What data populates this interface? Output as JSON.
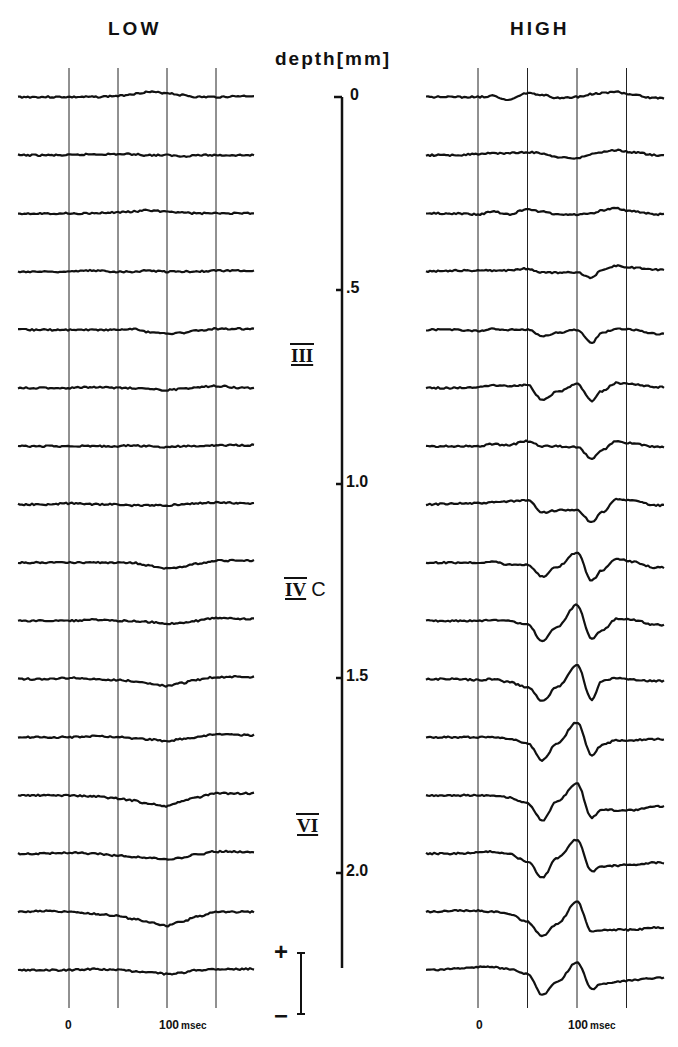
{
  "titles": {
    "low": "LOW",
    "high": "HIGH",
    "depth_axis": "depth[mm]"
  },
  "depth_axis": {
    "ticks": [
      "0",
      ".5",
      "1.0",
      "1.5",
      "2.0"
    ],
    "layers": [
      {
        "label": "III",
        "suffix": ""
      },
      {
        "label": "IV",
        "suffix": "C"
      },
      {
        "label": "VI",
        "suffix": ""
      }
    ]
  },
  "time_axis": {
    "low": {
      "zero": "0",
      "hundred": "100",
      "unit": "msec"
    },
    "high": {
      "zero": "0",
      "hundred": "100",
      "unit": "msec"
    }
  },
  "polarity": {
    "plus": "+",
    "minus": "−"
  },
  "chart_data": [
    {
      "type": "line",
      "title": "LOW",
      "description": "16 stacked field-potential traces at increasing cortical depth (0 to ~2.25 mm, ~0.15 mm spacing)",
      "xlabel": "msec",
      "x_tick_labels": [
        "0",
        "100 msec"
      ],
      "x_gridlines_msec": [
        0,
        50,
        100,
        150
      ],
      "x_range_msec": [
        -50,
        180
      ],
      "ylabel": "depth [mm]",
      "depths_mm": [
        0.0,
        0.15,
        0.3,
        0.45,
        0.6,
        0.75,
        0.9,
        1.05,
        1.2,
        1.35,
        1.5,
        1.65,
        1.8,
        1.95,
        2.1,
        2.25
      ],
      "x": [
        -50,
        -25,
        0,
        25,
        50,
        65,
        80,
        100,
        115,
        130,
        150,
        180
      ],
      "series": [
        {
          "name": "d0.00",
          "values": [
            0,
            0,
            0,
            0,
            1,
            3,
            5,
            4,
            2,
            0,
            0,
            1
          ]
        },
        {
          "name": "d0.15",
          "values": [
            0,
            0,
            0,
            1,
            1,
            1,
            0,
            0,
            -1,
            0,
            0,
            0
          ]
        },
        {
          "name": "d0.30",
          "values": [
            0,
            0,
            0,
            0,
            1,
            2,
            3,
            2,
            1,
            0,
            0,
            0
          ]
        },
        {
          "name": "d0.45",
          "values": [
            0,
            0,
            0,
            1,
            0,
            0,
            1,
            0,
            0,
            0,
            1,
            1
          ]
        },
        {
          "name": "d0.60",
          "values": [
            0,
            0,
            0,
            0,
            0,
            1,
            -2,
            -4,
            -3,
            -1,
            1,
            1
          ]
        },
        {
          "name": "d0.75",
          "values": [
            0,
            0,
            0,
            1,
            0,
            0,
            -1,
            -2,
            -1,
            1,
            2,
            0
          ]
        },
        {
          "name": "d0.90",
          "values": [
            0,
            0,
            0,
            0,
            0,
            1,
            0,
            -1,
            0,
            0,
            1,
            1
          ]
        },
        {
          "name": "d1.05",
          "values": [
            0,
            0,
            1,
            0,
            0,
            -1,
            -1,
            -1,
            0,
            1,
            2,
            1
          ]
        },
        {
          "name": "d1.20",
          "values": [
            0,
            0,
            0,
            0,
            0,
            0,
            -3,
            -6,
            -4,
            -1,
            2,
            2
          ]
        },
        {
          "name": "d1.35",
          "values": [
            0,
            0,
            0,
            1,
            0,
            0,
            -1,
            -3,
            -2,
            0,
            3,
            2
          ]
        },
        {
          "name": "d1.50",
          "values": [
            0,
            0,
            1,
            0,
            -1,
            -2,
            -4,
            -7,
            -4,
            -1,
            2,
            2
          ]
        },
        {
          "name": "d1.65",
          "values": [
            0,
            0,
            0,
            1,
            0,
            -1,
            -2,
            -4,
            -2,
            0,
            3,
            2
          ]
        },
        {
          "name": "d1.80",
          "values": [
            0,
            0,
            0,
            -1,
            -3,
            -5,
            -8,
            -11,
            -6,
            -2,
            2,
            2
          ]
        },
        {
          "name": "d1.95",
          "values": [
            0,
            0,
            1,
            0,
            -2,
            -3,
            -4,
            -6,
            -4,
            -1,
            2,
            2
          ]
        },
        {
          "name": "d2.10",
          "values": [
            0,
            1,
            0,
            -2,
            -4,
            -7,
            -10,
            -14,
            -10,
            -5,
            0,
            0
          ]
        },
        {
          "name": "d2.25",
          "values": [
            0,
            0,
            0,
            1,
            0,
            -1,
            -2,
            -4,
            -3,
            0,
            1,
            1
          ]
        }
      ],
      "units": "relative deflection (px-scaled, upward positive)"
    },
    {
      "type": "line",
      "title": "HIGH",
      "description": "16 stacked field-potential traces at increasing cortical depth; prominent negative wave ~65 msec and ~125 msec in deep layers, positive peak ~100 msec",
      "xlabel": "msec",
      "x_tick_labels": [
        "0",
        "100 msec"
      ],
      "x_gridlines_msec": [
        0,
        50,
        100,
        150
      ],
      "x_range_msec": [
        -50,
        180
      ],
      "ylabel": "depth [mm]",
      "depths_mm": [
        0.0,
        0.15,
        0.3,
        0.45,
        0.6,
        0.75,
        0.9,
        1.05,
        1.2,
        1.35,
        1.5,
        1.65,
        1.8,
        1.95,
        2.1,
        2.25
      ],
      "x": [
        -50,
        -25,
        0,
        15,
        30,
        50,
        65,
        80,
        100,
        115,
        125,
        140,
        155,
        180
      ],
      "series": [
        {
          "name": "d0.00",
          "values": [
            0,
            0,
            0,
            1,
            -3,
            4,
            2,
            -1,
            0,
            3,
            4,
            5,
            2,
            -1
          ]
        },
        {
          "name": "d0.15",
          "values": [
            0,
            0,
            1,
            2,
            2,
            3,
            2,
            -2,
            -3,
            1,
            3,
            5,
            3,
            0
          ]
        },
        {
          "name": "d0.30",
          "values": [
            0,
            0,
            -1,
            2,
            -1,
            4,
            2,
            -1,
            -1,
            0,
            3,
            5,
            2,
            -1
          ]
        },
        {
          "name": "d0.45",
          "values": [
            0,
            1,
            1,
            1,
            1,
            3,
            -1,
            -1,
            -1,
            -6,
            2,
            6,
            4,
            2
          ]
        },
        {
          "name": "d0.60",
          "values": [
            0,
            0,
            -1,
            1,
            0,
            0,
            -6,
            -3,
            0,
            -13,
            -3,
            1,
            0,
            -4
          ]
        },
        {
          "name": "d0.75",
          "values": [
            0,
            0,
            1,
            3,
            2,
            3,
            -12,
            -4,
            4,
            -13,
            -3,
            5,
            4,
            1
          ]
        },
        {
          "name": "d0.90",
          "values": [
            0,
            0,
            0,
            2,
            1,
            5,
            0,
            0,
            -1,
            -12,
            -4,
            5,
            3,
            -1
          ]
        },
        {
          "name": "d1.05",
          "values": [
            0,
            1,
            1,
            2,
            3,
            4,
            -8,
            -6,
            -6,
            -18,
            -8,
            5,
            4,
            -1
          ]
        },
        {
          "name": "d1.20",
          "values": [
            0,
            0,
            0,
            1,
            -2,
            -2,
            -14,
            -4,
            10,
            -18,
            -8,
            4,
            1,
            -5
          ]
        },
        {
          "name": "d1.35",
          "values": [
            0,
            0,
            0,
            1,
            0,
            -4,
            -20,
            -6,
            16,
            -18,
            -10,
            2,
            1,
            -4
          ]
        },
        {
          "name": "d1.50",
          "values": [
            0,
            0,
            -1,
            0,
            -3,
            -8,
            -22,
            -8,
            14,
            -21,
            -2,
            1,
            -1,
            -2
          ]
        },
        {
          "name": "d1.65",
          "values": [
            0,
            0,
            0,
            0,
            -1,
            -6,
            -23,
            -6,
            15,
            -18,
            -8,
            -3,
            -3,
            -2
          ]
        },
        {
          "name": "d1.80",
          "values": [
            0,
            0,
            0,
            0,
            -2,
            -8,
            -25,
            -6,
            12,
            -22,
            -14,
            -15,
            -15,
            -11
          ]
        },
        {
          "name": "d1.95",
          "values": [
            0,
            0,
            1,
            2,
            0,
            -8,
            -24,
            -4,
            14,
            -18,
            -13,
            -12,
            -11,
            -9
          ]
        },
        {
          "name": "d2.10",
          "values": [
            0,
            1,
            1,
            0,
            -2,
            -10,
            -24,
            -12,
            10,
            -20,
            -18,
            -18,
            -18,
            -16
          ]
        },
        {
          "name": "d2.25",
          "values": [
            0,
            1,
            3,
            3,
            1,
            -4,
            -25,
            -12,
            8,
            -19,
            -14,
            -12,
            -10,
            -8
          ]
        }
      ],
      "units": "relative deflection (px-scaled, upward positive)"
    }
  ]
}
